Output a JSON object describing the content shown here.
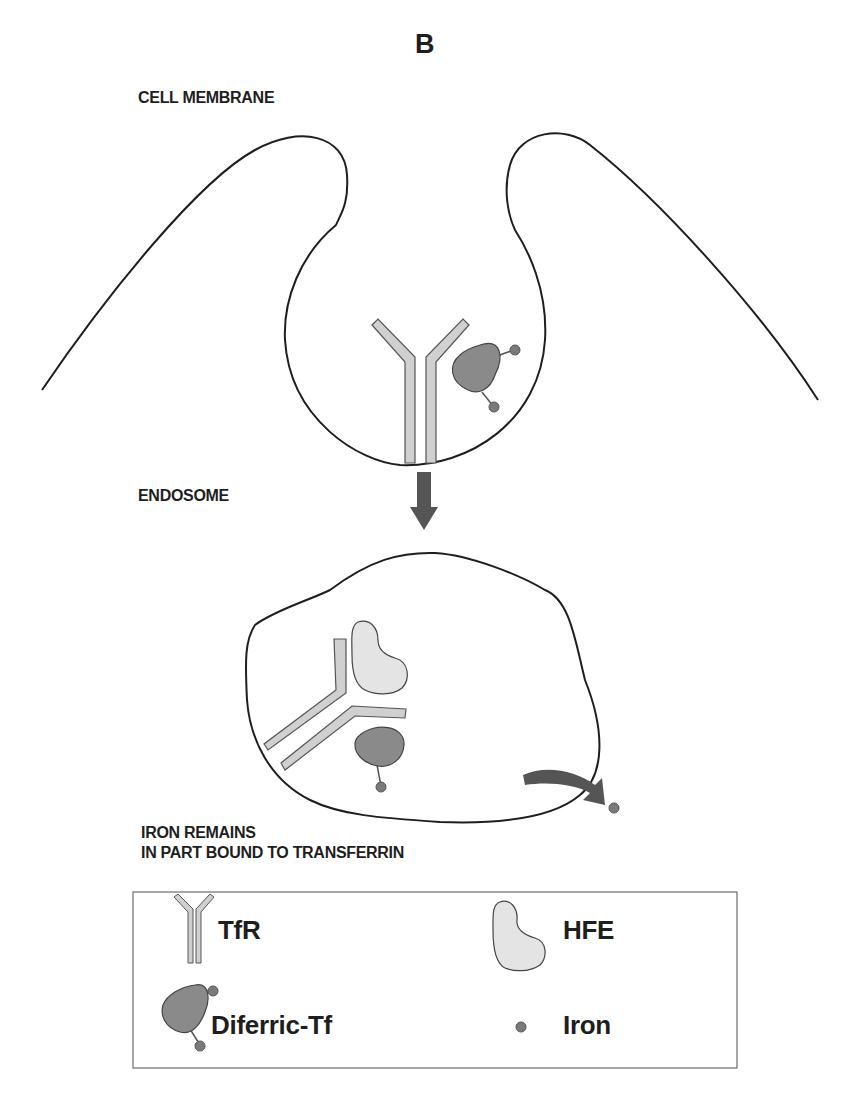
{
  "figure": {
    "panel_letter": "B",
    "labels": {
      "cell_membrane": "CELL MEMBRANE",
      "endosome": "ENDOSOME",
      "iron_remains_line1": "IRON REMAINS",
      "iron_remains_line2": "IN PART BOUND TO TRANSFERRIN"
    },
    "legend": {
      "items": [
        {
          "icon": "tfr-receptor-icon",
          "label": "TfR"
        },
        {
          "icon": "hfe-protein-icon",
          "label": "HFE"
        },
        {
          "icon": "diferric-tf-icon",
          "label": "Diferric-Tf"
        },
        {
          "icon": "iron-dot-icon",
          "label": "Iron"
        }
      ]
    },
    "colors": {
      "outline": "#1e1e1e",
      "tfr_fill": "#d0d0d0",
      "hfe_fill": "#e4e4e4",
      "tf_fill": "#8a8a8a",
      "iron_fill": "#7a7a7a",
      "arrow_fill": "#555555"
    }
  }
}
